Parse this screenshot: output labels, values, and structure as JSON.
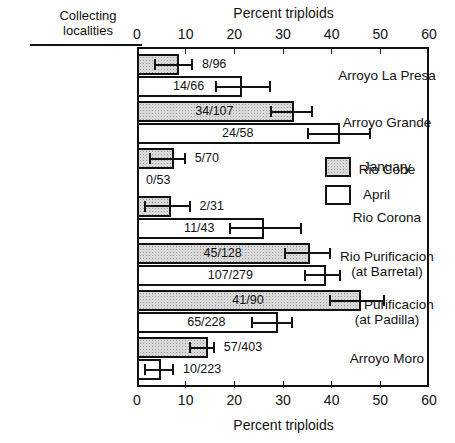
{
  "header": {
    "line1": "Collecting",
    "line2": "localities"
  },
  "chart_data": {
    "type": "bar",
    "orientation": "horizontal",
    "title": "",
    "top_axis_label": "Percent triploids",
    "xlabel": "Percent triploids",
    "ylabel": "Collecting localities",
    "xlim": [
      0,
      60
    ],
    "xticks": [
      0,
      10,
      20,
      30,
      40,
      50,
      60
    ],
    "xticklabels": [
      "0",
      "10",
      "20",
      "30",
      "40",
      "50",
      "60"
    ],
    "grid": false,
    "legend_position": "center-right",
    "legend": [
      "January",
      "April"
    ],
    "series": [
      {
        "name": "January",
        "values": [
          8.3,
          31.8,
          7.1,
          6.5,
          35.2,
          45.6,
          14.1
        ],
        "labels": [
          "8/96",
          "34/107",
          "5/70",
          "2/31",
          "45/128",
          "41/90",
          "57/403"
        ],
        "err_low": [
          3.4,
          27.3,
          2.5,
          1.5,
          30.3,
          39.5,
          10.7
        ],
        "err_high": [
          11.5,
          36.2,
          10.0,
          11.0,
          39.8,
          51.0,
          16.0
        ]
      },
      {
        "name": "April",
        "values": [
          21.2,
          41.4,
          0.0,
          25.6,
          38.4,
          28.5,
          4.5
        ],
        "labels": [
          "14/66",
          "24/58",
          "0/53",
          "11/43",
          "107/279",
          "65/228",
          "10/223"
        ],
        "err_low": [
          16.0,
          35.0,
          0.0,
          19.0,
          34.3,
          23.5,
          1.5
        ],
        "err_high": [
          27.5,
          48.0,
          0.0,
          34.0,
          42.0,
          32.0,
          7.6
        ]
      }
    ],
    "categories": [
      {
        "lines": [
          "Arroyo La Presa"
        ]
      },
      {
        "lines": [
          "Arroyo Grande"
        ]
      },
      {
        "lines": [
          "Rio Cobe"
        ]
      },
      {
        "lines": [
          "Rio Corona"
        ]
      },
      {
        "lines": [
          "Rio Purificacion",
          "(at Barretal)"
        ]
      },
      {
        "lines": [
          "Rio Purificacion",
          "(at Padilla)"
        ]
      },
      {
        "lines": [
          "Arroyo Moro"
        ]
      }
    ]
  }
}
